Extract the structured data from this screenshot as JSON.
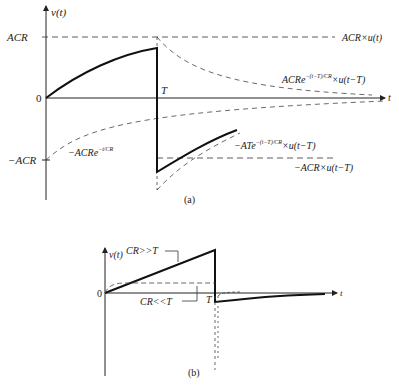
{
  "panel_a": {
    "caption": "(a)",
    "y_axis_label": "v(t)",
    "x_axis_label": "t",
    "origin_label": "0",
    "acr_label": "ACR",
    "neg_acr_label": "−ACR",
    "t_label": "T",
    "curves": {
      "step_label": "ACR×u(t)",
      "decay_label_main": "ACRe",
      "decay_label_exp": "−(t−T)/CR",
      "decay_label_tail": "×u(t−T)",
      "neg_exp_label_main": "−ACRe",
      "neg_exp_label_exp": "−t/CR",
      "neg_shift_label_main": "−ATe",
      "neg_shift_label_exp": "−(t−T)/CR",
      "neg_shift_label_tail": "×u(t−T)",
      "neg_step_label": "−ACR×u(t−T)"
    }
  },
  "panel_b": {
    "caption": "(b)",
    "y_axis_label": "v(t)",
    "x_axis_label": "t",
    "origin_label": "0",
    "t_label": "T",
    "large_cr_label": "CR>>T",
    "small_cr_label": "CR<<T"
  }
}
